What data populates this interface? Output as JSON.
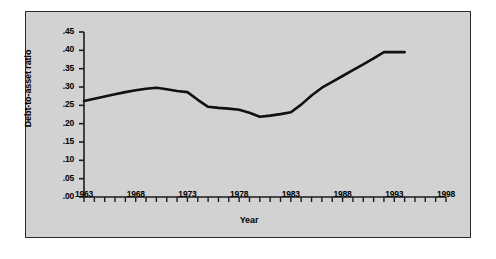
{
  "chart_data": {
    "type": "line",
    "title": "",
    "xlabel": "Year",
    "ylabel": "Debt-to-asset ratio",
    "xlim": [
      1963,
      1998
    ],
    "ylim": [
      0.0,
      0.45
    ],
    "grid": false,
    "legend": false,
    "y_tick_labels": [
      ".00",
      ".05",
      ".10",
      ".15",
      ".20",
      ".25",
      ".30",
      ".35",
      ".40",
      ".45"
    ],
    "y_tick_values": [
      0.0,
      0.05,
      0.1,
      0.15,
      0.2,
      0.25,
      0.3,
      0.35,
      0.4,
      0.45
    ],
    "x_tick_labels": [
      "1963",
      "1968",
      "1973",
      "1978",
      "1983",
      "1988",
      "1993",
      "1998"
    ],
    "x_tick_values": [
      1963,
      1968,
      1973,
      1978,
      1983,
      1988,
      1993,
      1998
    ],
    "x_minor_tick_step": 1,
    "line_color": "#111111",
    "line_width": 2.6,
    "series": [
      {
        "name": "Debt-to-asset ratio",
        "x": [
          1963,
          1964,
          1965,
          1966,
          1967,
          1968,
          1969,
          1970,
          1971,
          1972,
          1973,
          1974,
          1975,
          1976,
          1977,
          1978,
          1979,
          1980,
          1981,
          1982,
          1983,
          1984,
          1985,
          1986,
          1987,
          1988,
          1989,
          1990,
          1991,
          1992,
          1993,
          1994
        ],
        "values": [
          0.262,
          0.268,
          0.274,
          0.28,
          0.286,
          0.291,
          0.295,
          0.298,
          0.294,
          0.289,
          0.286,
          0.265,
          0.246,
          0.243,
          0.241,
          0.238,
          0.23,
          0.219,
          0.222,
          0.226,
          0.231,
          0.252,
          0.277,
          0.298,
          0.314,
          0.33,
          0.346,
          0.362,
          0.378,
          0.395,
          0.395,
          0.395
        ]
      }
    ]
  },
  "axis": {
    "y_title": "Debt-to-asset ratio",
    "x_title": "Year"
  }
}
